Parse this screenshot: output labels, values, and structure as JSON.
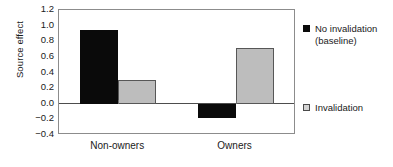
{
  "chart_data": {
    "type": "bar",
    "title": "",
    "xlabel": "",
    "ylabel": "Source effect",
    "categories": [
      "Non-owners",
      "Owners"
    ],
    "series": [
      {
        "name": "No invalidation (baseline)",
        "color": "#0a0a0a",
        "values": [
          0.95,
          -0.18
        ]
      },
      {
        "name": "Invalidation",
        "color": "#bdbdbd",
        "values": [
          0.3,
          0.72
        ]
      }
    ],
    "ylim": [
      -0.4,
      1.2
    ],
    "yticks": [
      "1.2",
      "1.0",
      "0.8",
      "0.6",
      "0.4",
      "0.2",
      "0.0",
      "-0.2",
      "-0.4"
    ],
    "ytick_values": [
      1.2,
      1.0,
      0.8,
      0.6,
      0.4,
      0.2,
      0.0,
      -0.2,
      -0.4
    ],
    "grid": false,
    "legend_position": "right",
    "zero_line": 0.0
  },
  "axis": {
    "y_title": "Source effect"
  },
  "legend": {
    "entries": [
      {
        "label": "No invalidation\n(baseline)",
        "swatch": "black-square-icon"
      },
      {
        "label": "Invalidation",
        "swatch": "gray-square-icon"
      }
    ]
  }
}
